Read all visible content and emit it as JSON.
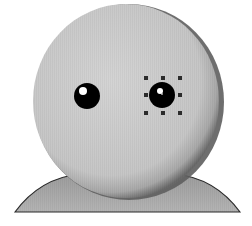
{
  "illustration": {
    "subject": "avatar-head",
    "colors": {
      "background": "#ffffff",
      "head_fill_light": "#d2d2d2",
      "head_fill_mid": "#c4c4c4",
      "head_rim_dark": "#6e6e6e",
      "shoulders_fill": "#a9a9a9",
      "shoulders_outline": "#2a2a2a",
      "eye": "#000000",
      "eye_highlight": "#ffffff",
      "handle": "#2b2b2b"
    },
    "head": {
      "cx": 127,
      "cy": 101,
      "rx": 95,
      "ry": 98
    },
    "shoulders": {
      "left": 15,
      "right": 240,
      "top": 175,
      "bottom": 212
    },
    "eyes": [
      {
        "name": "left-eye",
        "cx": 87,
        "cy": 96,
        "r": 13,
        "highlight": {
          "cx": 83,
          "cy": 91,
          "r": 4
        },
        "selected": false
      },
      {
        "name": "right-eye",
        "cx": 162,
        "cy": 95,
        "r": 13,
        "highlight": {
          "cx": 160,
          "cy": 91,
          "r": 3
        },
        "selected": true
      }
    ],
    "selection": {
      "target": "right-eye",
      "bounds": {
        "x": 145,
        "y": 77,
        "width": 35,
        "height": 36
      },
      "handle_size": 4
    }
  }
}
